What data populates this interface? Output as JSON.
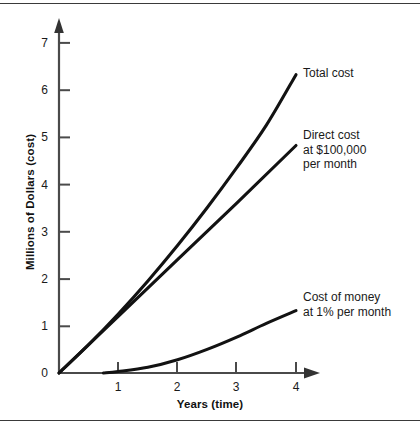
{
  "chart_data": {
    "type": "line",
    "title": "",
    "xlabel": "Years (time)",
    "ylabel": "Millions of Dollars (cost)",
    "xlim": [
      0,
      4.5
    ],
    "ylim": [
      0,
      7.4
    ],
    "xticks": [
      "1",
      "2",
      "3",
      "4"
    ],
    "xtick_values": [
      1,
      2,
      3,
      4
    ],
    "yticks": [
      "0",
      "1",
      "2",
      "3",
      "4",
      "5",
      "6",
      "7"
    ],
    "ytick_values": [
      0,
      1,
      2,
      3,
      4,
      5,
      6,
      7
    ],
    "grid": false,
    "legend_position": "inline-right-annotations",
    "axis_style": "arrow-ended L-axes",
    "series": [
      {
        "name": "Total cost",
        "annotation": "Total cost",
        "style": "curve",
        "x": [
          0,
          0.5,
          1,
          1.5,
          2,
          2.5,
          3,
          3.5,
          4
        ],
        "values": [
          0,
          0.6,
          1.25,
          1.95,
          2.7,
          3.5,
          4.35,
          5.25,
          6.32
        ]
      },
      {
        "name": "Direct cost at $100,000 per month",
        "annotation": "Direct cost\nat $100,000\nper month",
        "style": "line",
        "x": [
          0,
          1,
          2,
          3,
          4
        ],
        "values": [
          0,
          1.2,
          2.4,
          3.6,
          4.82
        ]
      },
      {
        "name": "Cost of money at 1% per month",
        "annotation": "Cost of money\nat 1% per month",
        "style": "curve",
        "x": [
          0.75,
          1,
          1.5,
          2,
          2.5,
          3,
          3.5,
          4
        ],
        "values": [
          0,
          0.03,
          0.12,
          0.28,
          0.5,
          0.76,
          1.05,
          1.32
        ]
      }
    ]
  },
  "annotations": {
    "total_cost": "Total cost",
    "direct_cost": "Direct cost\nat $100,000\nper month",
    "cost_of_money": "Cost of money\nat 1% per month"
  },
  "axes": {
    "x_title": "Years (time)",
    "y_title": "Millions of Dollars (cost)",
    "x_tick_labels": [
      "1",
      "2",
      "3",
      "4"
    ],
    "y_tick_labels": [
      "0",
      "1",
      "2",
      "3",
      "4",
      "5",
      "6",
      "7"
    ]
  },
  "colors": {
    "ink": "#1a1a1a",
    "axis": "#4a4a4a",
    "background": "#ffffff",
    "rule": "#3a3a3a"
  }
}
